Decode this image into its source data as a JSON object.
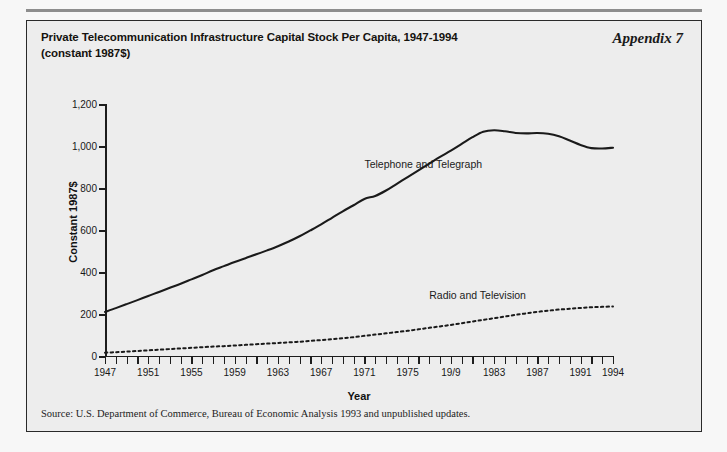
{
  "page": {
    "background": "#f7f7f7",
    "panel_background": "#ededed",
    "border_color": "#2a2a2a"
  },
  "header": {
    "title_line1": "Private Telecommunication Infrastructure Capital Stock Per Capita, 1947-1994",
    "title_line2": "(constant 1987$)",
    "appendix_label": "Appendix 7"
  },
  "footer": {
    "source": "Source: U.S. Department of Commerce, Bureau of Economic Analysis 1993 and unpublished updates."
  },
  "chart_data": {
    "type": "line",
    "title": "Private Telecommunication Infrastructure Capital Stock Per Capita, 1947-1994 (constant 1987$)",
    "xlabel": "Year",
    "ylabel": "Constant 1987$",
    "xlim": [
      1947,
      1994
    ],
    "ylim": [
      0,
      1200
    ],
    "yticks": [
      0,
      200,
      400,
      600,
      800,
      1000,
      1200
    ],
    "ytick_labels": [
      "0",
      "200",
      "400",
      "600",
      "800",
      "1,000",
      "1,200"
    ],
    "xticks": [
      1947,
      1948,
      1949,
      1950,
      1951,
      1952,
      1953,
      1954,
      1955,
      1956,
      1957,
      1958,
      1959,
      1960,
      1961,
      1962,
      1963,
      1964,
      1965,
      1966,
      1967,
      1968,
      1969,
      1970,
      1971,
      1972,
      1973,
      1974,
      1975,
      1976,
      1977,
      1978,
      1979,
      1980,
      1981,
      1982,
      1983,
      1984,
      1985,
      1986,
      1987,
      1988,
      1989,
      1990,
      1991,
      1992,
      1993,
      1994
    ],
    "xtick_labels": [
      {
        "year": 1947,
        "label": "1947"
      },
      {
        "year": 1951,
        "label": "1951"
      },
      {
        "year": 1955,
        "label": "1955"
      },
      {
        "year": 1959,
        "label": "1959"
      },
      {
        "year": 1963,
        "label": "1963"
      },
      {
        "year": 1967,
        "label": "1967"
      },
      {
        "year": 1971,
        "label": "1971"
      },
      {
        "year": 1975,
        "label": "1975"
      },
      {
        "year": 1979,
        "label": "19/9"
      },
      {
        "year": 1983,
        "label": "1983"
      },
      {
        "year": 1987,
        "label": "1987"
      },
      {
        "year": 1991,
        "label": "1991"
      },
      {
        "year": 1994,
        "label": "1994"
      }
    ],
    "grid": false,
    "legend": "inline-annotations",
    "x": [
      1947,
      1948,
      1949,
      1950,
      1951,
      1952,
      1953,
      1954,
      1955,
      1956,
      1957,
      1958,
      1959,
      1960,
      1961,
      1962,
      1963,
      1964,
      1965,
      1966,
      1967,
      1968,
      1969,
      1970,
      1971,
      1972,
      1973,
      1974,
      1975,
      1976,
      1977,
      1978,
      1979,
      1980,
      1981,
      1982,
      1983,
      1984,
      1985,
      1986,
      1987,
      1988,
      1989,
      1990,
      1991,
      1992,
      1993,
      1994
    ],
    "series": [
      {
        "name": "Telephone and Telegraph",
        "style": "solid",
        "color": "#1a1a1a",
        "label_x": 1971,
        "label_y": 915,
        "values": [
          210,
          228,
          247,
          266,
          286,
          305,
          325,
          344,
          365,
          386,
          408,
          428,
          448,
          466,
          484,
          503,
          523,
          545,
          570,
          598,
          627,
          658,
          689,
          718,
          748,
          762,
          788,
          820,
          852,
          884,
          916,
          948,
          978,
          1010,
          1042,
          1068,
          1075,
          1070,
          1062,
          1060,
          1062,
          1058,
          1046,
          1026,
          1005,
          990,
          988,
          992
        ]
      },
      {
        "name": "Radio and Television",
        "style": "dotted",
        "color": "#1a1a1a",
        "label_x": 1977,
        "label_y": 290,
        "values": [
          16,
          18,
          21,
          24,
          27,
          30,
          33,
          36,
          39,
          42,
          45,
          47,
          50,
          53,
          56,
          59,
          62,
          65,
          68,
          72,
          76,
          80,
          85,
          90,
          96,
          102,
          108,
          114,
          120,
          127,
          134,
          141,
          148,
          156,
          164,
          172,
          180,
          188,
          196,
          203,
          210,
          216,
          221,
          225,
          229,
          232,
          234,
          236
        ]
      }
    ]
  }
}
